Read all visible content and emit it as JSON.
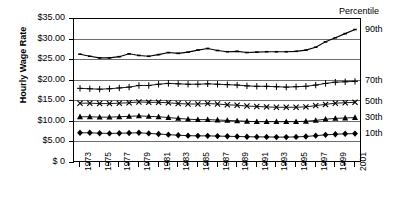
{
  "chart_data": {
    "type": "line",
    "title": "",
    "xlabel": "",
    "ylabel": "Hourly Wage Rate",
    "ylim": [
      0,
      35
    ],
    "ytick_labels": [
      "$35.00",
      "$30.00",
      "$25.00",
      "$20.00",
      "$15.00",
      "$10.00",
      "$5.00",
      "$ 0"
    ],
    "ytick_values": [
      35,
      30,
      25,
      20,
      15,
      10,
      5,
      0
    ],
    "grid": true,
    "legend_position": "right",
    "legend_title": "Percentile",
    "x": [
      1973,
      1974,
      1975,
      1976,
      1977,
      1978,
      1979,
      1980,
      1981,
      1982,
      1983,
      1984,
      1985,
      1986,
      1987,
      1988,
      1989,
      1990,
      1991,
      1992,
      1993,
      1994,
      1995,
      1996,
      1997,
      1998,
      1999,
      2000,
      2001
    ],
    "xtick_labels": [
      "1973",
      "1975",
      "1977",
      "1979",
      "1981",
      "1983",
      "1985",
      "1987",
      "1989",
      "1991",
      "1993",
      "1995",
      "1997",
      "1999",
      "2001"
    ],
    "series": [
      {
        "name": "90th",
        "marker": "none",
        "values": [
          26.2,
          25.7,
          25.3,
          25.3,
          25.6,
          26.3,
          25.9,
          25.7,
          26.1,
          26.6,
          26.4,
          26.7,
          27.2,
          27.6,
          27.1,
          26.8,
          26.9,
          26.6,
          26.7,
          26.8,
          26.8,
          26.8,
          26.9,
          27.2,
          27.9,
          29.2,
          30.2,
          31.2,
          32.2
        ]
      },
      {
        "name": "70th",
        "marker": "plus",
        "values": [
          17.9,
          17.8,
          17.7,
          17.8,
          18.0,
          18.2,
          18.6,
          18.6,
          18.9,
          19.1,
          19.0,
          18.9,
          18.9,
          19.0,
          18.9,
          18.8,
          18.7,
          18.5,
          18.4,
          18.4,
          18.3,
          18.2,
          18.3,
          18.4,
          18.7,
          19.1,
          19.4,
          19.5,
          19.6
        ]
      },
      {
        "name": "50th",
        "marker": "x",
        "values": [
          14.3,
          14.3,
          14.2,
          14.2,
          14.3,
          14.4,
          14.6,
          14.5,
          14.5,
          14.4,
          14.2,
          14.1,
          14.1,
          14.2,
          14.1,
          13.9,
          13.8,
          13.6,
          13.5,
          13.4,
          13.3,
          13.3,
          13.3,
          13.4,
          13.7,
          14.0,
          14.3,
          14.4,
          14.5
        ]
      },
      {
        "name": "30th",
        "marker": "triangle",
        "values": [
          11.0,
          11.0,
          10.9,
          10.9,
          11.0,
          11.1,
          11.2,
          11.1,
          11.0,
          10.8,
          10.6,
          10.4,
          10.3,
          10.3,
          10.2,
          10.1,
          10.0,
          9.9,
          9.8,
          9.8,
          9.8,
          9.8,
          9.8,
          9.9,
          10.1,
          10.4,
          10.6,
          10.7,
          10.8
        ]
      },
      {
        "name": "10th",
        "marker": "diamond",
        "values": [
          7.1,
          7.1,
          7.0,
          6.95,
          7.0,
          7.05,
          7.1,
          6.95,
          6.8,
          6.65,
          6.5,
          6.4,
          6.35,
          6.35,
          6.3,
          6.25,
          6.2,
          6.15,
          6.1,
          6.1,
          6.05,
          6.05,
          6.1,
          6.2,
          6.4,
          6.6,
          6.75,
          6.85,
          6.9
        ]
      }
    ],
    "right_labels": [
      {
        "text": "90th",
        "value": 32.2
      },
      {
        "text": "70th",
        "value": 19.6
      },
      {
        "text": "50th",
        "value": 14.5
      },
      {
        "text": "30th",
        "value": 10.8
      },
      {
        "text": "10th",
        "value": 6.9
      }
    ]
  }
}
